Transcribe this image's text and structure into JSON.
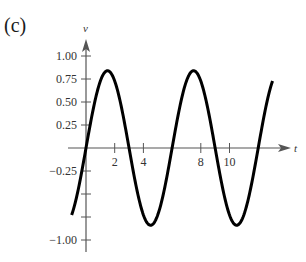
{
  "panel_label": "(c)",
  "chart_data": {
    "type": "line",
    "title": "",
    "xlabel": "t",
    "ylabel": "v",
    "x_ticks": [
      2,
      4,
      8,
      10
    ],
    "x_tick_labels": [
      "2",
      "4",
      "8",
      "10"
    ],
    "y_ticks": [
      1.0,
      0.75,
      0.5,
      0.25,
      -0.25,
      -0.5,
      -0.75,
      -1.0
    ],
    "y_tick_labels": [
      "1.00",
      "0.75",
      "0.50",
      "0.25",
      "−0.25",
      "",
      "",
      "−1.00"
    ],
    "xlim": [
      -1,
      13
    ],
    "ylim": [
      -1.0,
      1.0
    ],
    "grid": false,
    "legend": null,
    "series": [
      {
        "name": "v(t)",
        "function": "0.84*sin(pi*t/3)",
        "amplitude": 0.84,
        "period": 6,
        "t_range": [
          -1,
          13
        ],
        "x": [
          -1,
          0,
          1.5,
          3,
          4.5,
          6,
          7.5,
          9,
          10.5,
          12,
          13
        ],
        "values": [
          -0.73,
          0,
          0.84,
          0,
          -0.84,
          0,
          0.84,
          0,
          -0.84,
          0,
          0.73
        ]
      }
    ],
    "colors": {
      "curve": "#000000",
      "axes": "#555555"
    }
  }
}
